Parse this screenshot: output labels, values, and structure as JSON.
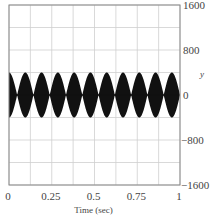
{
  "chart_data": {
    "type": "line",
    "title": "",
    "xlabel": "Time (sec)",
    "ylabel": "y",
    "xlim": [
      0,
      1
    ],
    "ylim": [
      -1600,
      1600
    ],
    "x_ticks": [
      0,
      0.25,
      0.5,
      0.75,
      1
    ],
    "x_tick_labels": [
      "0",
      "0.25",
      "0.5",
      "0.75",
      "1"
    ],
    "y_ticks": [
      1600,
      800,
      0,
      -800,
      -1600
    ],
    "y_tick_labels": [
      "1600",
      "800",
      "0",
      "−800",
      "−1600"
    ],
    "grid": true,
    "grid_x_step": 0.125,
    "grid_y_step": 400,
    "y_axis_position": "right",
    "series": [
      {
        "name": "y(t)",
        "description": "High-frequency oscillation with beating envelope; appears as filled black lobes",
        "envelope_amplitude": 400,
        "beat_lobes": 10.5,
        "color": "#111111"
      }
    ]
  }
}
